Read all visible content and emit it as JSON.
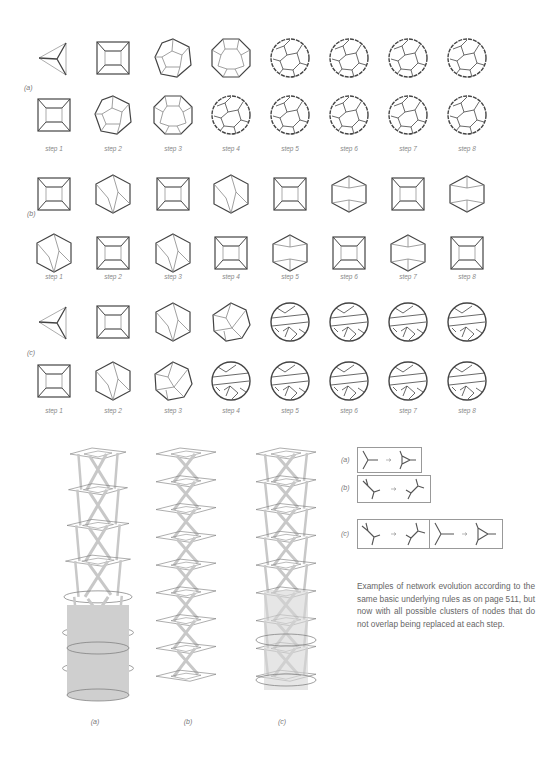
{
  "figure": {
    "panels": [
      {
        "label": "(a)",
        "steps": [
          "step 1",
          "step 2",
          "step 3",
          "step 4",
          "step 5",
          "step 6",
          "step 7",
          "step 8"
        ],
        "row1_shapes": [
          "tetrahedron",
          "cube",
          "dodecahedron-like",
          "truncated",
          "sphere",
          "sphere",
          "sphere",
          "sphere"
        ],
        "row2_shapes": [
          "cube",
          "dodecahedron-like",
          "truncated",
          "sphere",
          "sphere",
          "sphere",
          "sphere",
          "sphere"
        ]
      },
      {
        "label": "(b)",
        "steps": [
          "step 1",
          "step 2",
          "step 3",
          "step 4",
          "step 5",
          "step 6",
          "step 7",
          "step 8"
        ],
        "row1_shapes": [
          "cube",
          "hexagon-twist",
          "cube",
          "hexagon-twist",
          "cube",
          "hexagon-prism",
          "cube",
          "hexagon-prism"
        ],
        "row2_shapes": [
          "hexagon-twist",
          "cube",
          "hexagon-twist",
          "cube",
          "hexagon-prism",
          "cube",
          "hexagon-prism",
          "cube"
        ]
      },
      {
        "label": "(c)",
        "steps": [
          "step 1",
          "step 2",
          "step 3",
          "step 4",
          "step 5",
          "step 6",
          "step 7",
          "step 8"
        ],
        "row1_shapes": [
          "tetrahedron",
          "cube",
          "hexagon-twist",
          "irregular",
          "banded-sphere",
          "banded-sphere",
          "banded-sphere",
          "banded-sphere"
        ],
        "row2_shapes": [
          "cube",
          "hexagon-twist",
          "irregular",
          "banded-sphere",
          "banded-sphere",
          "banded-sphere",
          "banded-sphere",
          "banded-sphere"
        ]
      }
    ],
    "stacks": [
      {
        "label": "(a)"
      },
      {
        "label": "(b)"
      },
      {
        "label": "(c)"
      }
    ],
    "rules": [
      {
        "label": "(a)",
        "description": "3-node Y → triangle"
      },
      {
        "label": "(b)",
        "description": "H-shape → rotated H-shape"
      },
      {
        "label": "(c)",
        "description": "H-shape → rotated H-shape; Y → triangle"
      }
    ],
    "caption": "Examples of network evolution according to the same basic underlying rules as on page 511, but now with all possible clusters of nodes that do not overlap being replaced at each step."
  }
}
